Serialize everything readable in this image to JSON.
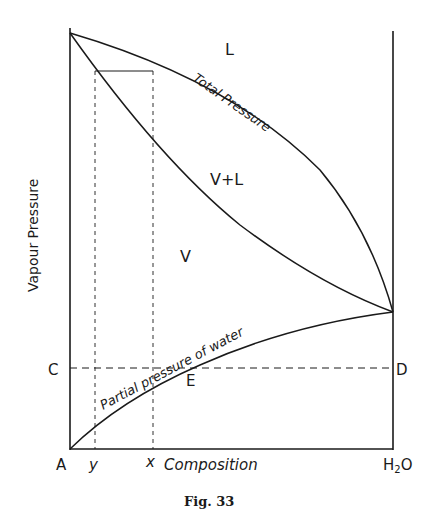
{
  "figure": {
    "caption": "Fig. 33",
    "y_axis_label": "Vapour Pressure",
    "x_axis_label": "Composition",
    "x_left_label": "A",
    "x_right_label_main": "H",
    "x_right_label_sub": "2",
    "x_right_label_end": "O",
    "left_point_label": "C",
    "right_point_label": "D",
    "intersection_label": "E",
    "composition_marks": {
      "y": "y",
      "x": "x"
    },
    "region_labels": {
      "liquid": "L",
      "two_phase": "V+L",
      "vapour": "V"
    },
    "curve_labels": {
      "total_pressure": "Total Pressure",
      "partial_pressure": "Partial pressure of water"
    },
    "colors": {
      "ink": "#1a1a1a",
      "background": "#ffffff"
    }
  }
}
